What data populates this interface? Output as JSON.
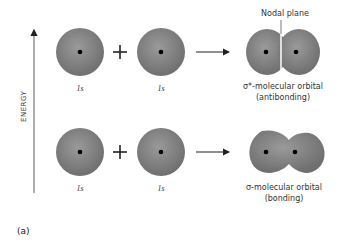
{
  "axis": {
    "label": "ENERGY"
  },
  "rows": [
    {
      "id": "antibonding",
      "atoms": [
        {
          "label": "1s"
        },
        {
          "label": "1s"
        }
      ],
      "operator": "+",
      "result": {
        "annotation": "Nodal plane",
        "caption_line1": "σ*-molecular orbital",
        "caption_line2": "(antibonding)"
      }
    },
    {
      "id": "bonding",
      "atoms": [
        {
          "label": "1s"
        },
        {
          "label": "1s"
        }
      ],
      "operator": "+",
      "result": {
        "caption_line1": "σ-molecular orbital",
        "caption_line2": "(bonding)"
      }
    }
  ],
  "part_label": "(a)",
  "colors": {
    "orbital_fill": "#8a8a8a",
    "orbital_edge": "#6e6e6e",
    "nucleus": "#000000"
  }
}
